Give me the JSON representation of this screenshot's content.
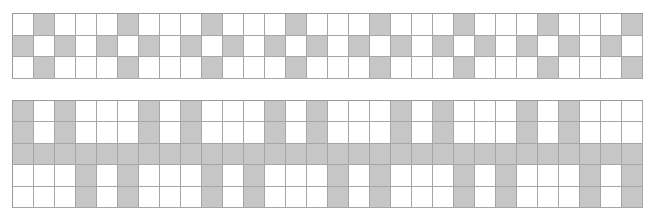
{
  "colors": {
    "filled": "#c6c6c6",
    "empty": "#ffffff",
    "border": "#a6a6a6"
  },
  "grids": [
    {
      "id": "grid-top",
      "columns": 30,
      "cell_width": 21,
      "cell_height": 21.7,
      "rows": [
        "010001000100010001000100010001",
        "101010101010101010101010101010",
        "010001000100010001000100010001"
      ]
    },
    {
      "id": "grid-bottom",
      "columns": 30,
      "cell_width": 21,
      "cell_height": 21.4,
      "rows": [
        "101000101000101000101000101000",
        "101000101000101000101000101000",
        "111111111111111111111111111111",
        "000101000101000101000101000101",
        "000101000101000101000101000101"
      ]
    }
  ]
}
